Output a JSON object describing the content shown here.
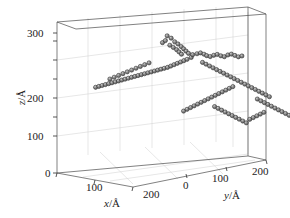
{
  "figure": {
    "type": "3d-scatter-plot",
    "background_color": "#ffffff",
    "box_line_color": "#4a4a4a",
    "grid_line_color": "#cccccc",
    "marker_fill_color": "#808080",
    "marker_edge_color": "#2b2b2b",
    "marker_highlight_color": "#d8d8d8"
  },
  "axes": {
    "x": {
      "title": "x",
      "unit": "/Å",
      "title_full": "x/Å",
      "ticks": [
        0,
        100,
        200
      ],
      "tick_labels": [
        "0",
        "100",
        "200"
      ],
      "range": [
        0,
        300
      ]
    },
    "y": {
      "title": "y",
      "unit": "/Å",
      "title_full": "y/Å",
      "ticks": [
        0,
        100,
        200
      ],
      "tick_labels": [
        "0",
        "100",
        "200"
      ],
      "range": [
        0,
        250
      ]
    },
    "z": {
      "title": "z",
      "unit": "/Å",
      "title_full": "z/Å",
      "ticks": [
        0,
        100,
        200,
        300
      ],
      "tick_labels": [
        "0",
        "100",
        "200",
        "300"
      ],
      "range": [
        0,
        340
      ]
    }
  },
  "chart_data": {
    "type": "scatter",
    "title": "",
    "xlabel": "x/Å",
    "ylabel": "y/Å",
    "zlabel": "z/Å",
    "xlim": [
      0,
      300
    ],
    "ylim": [
      0,
      250
    ],
    "zlim": [
      0,
      340
    ],
    "grid": true,
    "legend": "none",
    "marker": "sphere",
    "marker_color": "#808080",
    "n_points": 330,
    "points": [
      [
        118,
        96,
        310
      ],
      [
        124,
        99,
        305
      ],
      [
        121,
        93,
        300
      ],
      [
        128,
        102,
        297
      ],
      [
        116,
        91,
        295
      ],
      [
        131,
        105,
        292
      ],
      [
        122,
        98,
        289
      ],
      [
        134,
        108,
        286
      ],
      [
        126,
        101,
        284
      ],
      [
        137,
        110,
        281
      ],
      [
        129,
        104,
        279
      ],
      [
        140,
        112,
        276
      ],
      [
        132,
        106,
        274
      ],
      [
        143,
        114,
        271
      ],
      [
        135,
        108,
        269
      ],
      [
        146,
        118,
        268
      ],
      [
        150,
        122,
        270
      ],
      [
        154,
        125,
        272
      ],
      [
        158,
        128,
        269
      ],
      [
        162,
        130,
        266
      ],
      [
        166,
        133,
        264
      ],
      [
        170,
        136,
        267
      ],
      [
        174,
        139,
        269
      ],
      [
        178,
        142,
        266
      ],
      [
        182,
        145,
        264
      ],
      [
        186,
        148,
        268
      ],
      [
        190,
        151,
        270
      ],
      [
        194,
        154,
        267
      ],
      [
        198,
        157,
        264
      ],
      [
        202,
        160,
        266
      ],
      [
        147,
        116,
        262
      ],
      [
        144,
        112,
        258
      ],
      [
        141,
        109,
        255
      ],
      [
        138,
        106,
        252
      ],
      [
        135,
        103,
        249
      ],
      [
        132,
        100,
        246
      ],
      [
        129,
        97,
        243
      ],
      [
        126,
        94,
        240
      ],
      [
        123,
        91,
        238
      ],
      [
        120,
        88,
        236
      ],
      [
        117,
        85,
        234
      ],
      [
        114,
        82,
        232
      ],
      [
        111,
        79,
        230
      ],
      [
        108,
        76,
        228
      ],
      [
        105,
        73,
        226
      ],
      [
        102,
        70,
        224
      ],
      [
        99,
        67,
        222
      ],
      [
        96,
        64,
        220
      ],
      [
        93,
        61,
        218
      ],
      [
        90,
        58,
        216
      ],
      [
        87,
        55,
        214
      ],
      [
        84,
        52,
        212
      ],
      [
        81,
        49,
        210
      ],
      [
        78,
        46,
        208
      ],
      [
        75,
        43,
        206
      ],
      [
        72,
        40,
        204
      ],
      [
        69,
        37,
        202
      ],
      [
        66,
        34,
        200
      ],
      [
        63,
        31,
        198
      ],
      [
        60,
        28,
        196
      ],
      [
        70,
        42,
        214
      ],
      [
        74,
        46,
        218
      ],
      [
        78,
        50,
        222
      ],
      [
        82,
        54,
        226
      ],
      [
        86,
        58,
        230
      ],
      [
        90,
        62,
        234
      ],
      [
        94,
        66,
        238
      ],
      [
        98,
        70,
        242
      ],
      [
        102,
        74,
        246
      ],
      [
        106,
        78,
        250
      ],
      [
        152,
        128,
        250
      ],
      [
        156,
        131,
        246
      ],
      [
        160,
        134,
        242
      ],
      [
        164,
        137,
        238
      ],
      [
        168,
        140,
        234
      ],
      [
        172,
        143,
        230
      ],
      [
        176,
        146,
        226
      ],
      [
        180,
        149,
        222
      ],
      [
        184,
        152,
        218
      ],
      [
        188,
        155,
        214
      ],
      [
        192,
        158,
        210
      ],
      [
        196,
        161,
        206
      ],
      [
        200,
        164,
        202
      ],
      [
        204,
        167,
        198
      ],
      [
        208,
        170,
        194
      ],
      [
        212,
        173,
        190
      ],
      [
        216,
        176,
        186
      ],
      [
        220,
        179,
        182
      ],
      [
        224,
        182,
        178
      ],
      [
        228,
        185,
        174
      ],
      [
        186,
        154,
        196
      ],
      [
        182,
        151,
        192
      ],
      [
        178,
        148,
        188
      ],
      [
        174,
        145,
        184
      ],
      [
        170,
        142,
        180
      ],
      [
        166,
        139,
        176
      ],
      [
        162,
        136,
        172
      ],
      [
        158,
        133,
        168
      ],
      [
        154,
        130,
        164
      ],
      [
        150,
        127,
        160
      ],
      [
        146,
        124,
        156
      ],
      [
        142,
        121,
        152
      ],
      [
        138,
        118,
        148
      ],
      [
        134,
        115,
        144
      ],
      [
        130,
        112,
        140
      ],
      [
        210,
        176,
        168
      ],
      [
        214,
        179,
        164
      ],
      [
        218,
        182,
        160
      ],
      [
        222,
        185,
        156
      ],
      [
        226,
        188,
        152
      ],
      [
        230,
        191,
        148
      ],
      [
        234,
        194,
        144
      ],
      [
        238,
        197,
        140
      ],
      [
        242,
        200,
        136
      ],
      [
        246,
        203,
        132
      ],
      [
        160,
        140,
        150
      ],
      [
        164,
        143,
        146
      ],
      [
        168,
        146,
        142
      ],
      [
        172,
        149,
        138
      ],
      [
        176,
        152,
        134
      ],
      [
        180,
        155,
        130
      ],
      [
        184,
        158,
        126
      ],
      [
        188,
        161,
        122
      ],
      [
        192,
        164,
        118
      ],
      [
        196,
        167,
        114
      ],
      [
        200,
        170,
        122
      ],
      [
        204,
        173,
        126
      ],
      [
        208,
        176,
        130
      ],
      [
        212,
        179,
        134
      ],
      [
        216,
        182,
        138
      ]
    ]
  }
}
